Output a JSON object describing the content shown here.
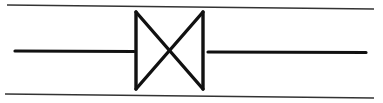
{
  "diagram": {
    "type": "valve-symbol",
    "symbol": "gate-valve",
    "colors": {
      "background": "#ffffff",
      "stroke": "#111111",
      "rule": "#333333"
    },
    "elements": {
      "top_rule": {
        "x1": 7,
        "y1": 5,
        "x2": 374,
        "y2": 9
      },
      "bottom_rule": {
        "x1": 5,
        "y1": 94,
        "x2": 374,
        "y2": 98
      },
      "pipe_left": {
        "x1": 15,
        "y1": 51,
        "x2": 134,
        "y2": 51
      },
      "pipe_right": {
        "x1": 208,
        "y1": 52,
        "x2": 366,
        "y2": 52
      },
      "valve_body": {
        "left_x": 136,
        "right_x": 203,
        "top_y": 12,
        "bottom_y": 89
      }
    }
  }
}
